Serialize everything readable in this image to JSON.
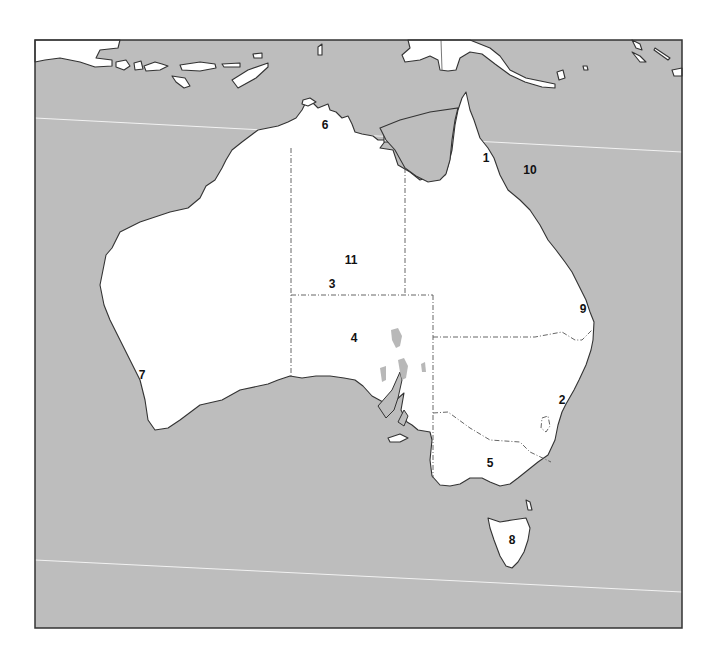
{
  "map": {
    "title": "",
    "colors": {
      "sea": "#bdbdbd",
      "land": "#ffffff",
      "coast": "#333333",
      "frame": "#333333",
      "lake": "#b8b8b8",
      "graticule": "#f2f2f2"
    },
    "labels": [
      {
        "id": "1",
        "text": "1",
        "x": 486,
        "y": 158
      },
      {
        "id": "2",
        "text": "2",
        "x": 562,
        "y": 400
      },
      {
        "id": "3",
        "text": "3",
        "x": 332,
        "y": 284
      },
      {
        "id": "4",
        "text": "4",
        "x": 354,
        "y": 338
      },
      {
        "id": "5",
        "text": "5",
        "x": 490,
        "y": 463
      },
      {
        "id": "6",
        "text": "6",
        "x": 325,
        "y": 125
      },
      {
        "id": "7",
        "text": "7",
        "x": 142,
        "y": 375
      },
      {
        "id": "8",
        "text": "8",
        "x": 512,
        "y": 540
      },
      {
        "id": "9",
        "text": "9",
        "x": 583,
        "y": 309
      },
      {
        "id": "10",
        "text": "10",
        "x": 530,
        "y": 170
      },
      {
        "id": "11",
        "text": "11",
        "x": 351,
        "y": 260
      }
    ]
  }
}
